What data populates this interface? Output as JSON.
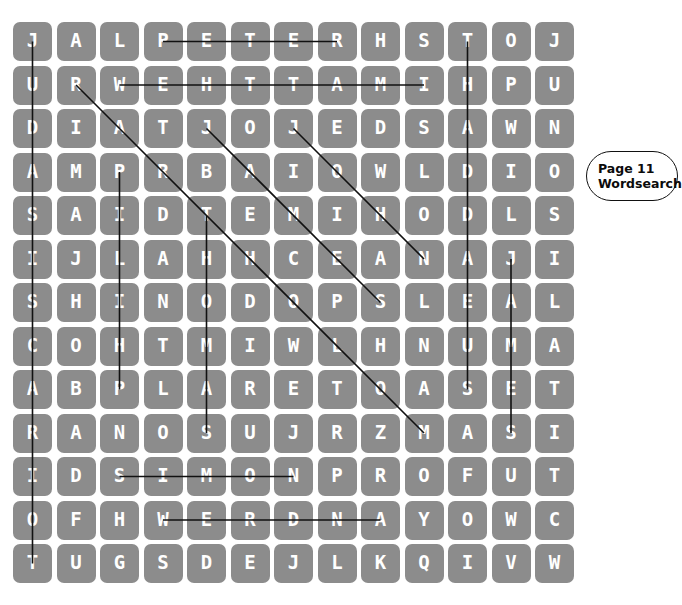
{
  "puzzle": {
    "type": "wordsearch",
    "rows": 13,
    "cols": 13,
    "cell_color": "#8c8c8c",
    "letter_color": "#ffffff",
    "line_color": "#111111",
    "grid": [
      [
        "J",
        "A",
        "L",
        "P",
        "E",
        "T",
        "E",
        "R",
        "H",
        "S",
        "T",
        "O",
        "J"
      ],
      [
        "U",
        "R",
        "W",
        "E",
        "H",
        "T",
        "T",
        "A",
        "M",
        "I",
        "H",
        "P",
        "U"
      ],
      [
        "D",
        "I",
        "A",
        "T",
        "J",
        "O",
        "J",
        "E",
        "D",
        "S",
        "A",
        "W",
        "N"
      ],
      [
        "A",
        "M",
        "P",
        "R",
        "B",
        "A",
        "I",
        "O",
        "W",
        "L",
        "D",
        "I",
        "O"
      ],
      [
        "S",
        "A",
        "I",
        "D",
        "T",
        "E",
        "M",
        "I",
        "H",
        "O",
        "D",
        "L",
        "S"
      ],
      [
        "I",
        "J",
        "L",
        "A",
        "H",
        "H",
        "C",
        "E",
        "A",
        "N",
        "A",
        "J",
        "I"
      ],
      [
        "S",
        "H",
        "I",
        "N",
        "O",
        "D",
        "O",
        "P",
        "S",
        "L",
        "E",
        "A",
        "L"
      ],
      [
        "C",
        "O",
        "H",
        "T",
        "M",
        "I",
        "W",
        "L",
        "H",
        "N",
        "U",
        "M",
        "A"
      ],
      [
        "A",
        "B",
        "P",
        "L",
        "A",
        "R",
        "E",
        "T",
        "O",
        "A",
        "S",
        "E",
        "T"
      ],
      [
        "R",
        "A",
        "N",
        "O",
        "S",
        "U",
        "J",
        "R",
        "Z",
        "M",
        "A",
        "S",
        "I"
      ],
      [
        "I",
        "D",
        "S",
        "I",
        "M",
        "O",
        "N",
        "P",
        "R",
        "O",
        "F",
        "U",
        "T"
      ],
      [
        "O",
        "F",
        "H",
        "W",
        "E",
        "R",
        "D",
        "N",
        "A",
        "Y",
        "O",
        "W",
        "C"
      ],
      [
        "T",
        "U",
        "G",
        "S",
        "D",
        "E",
        "J",
        "L",
        "K",
        "Q",
        "I",
        "V",
        "W"
      ]
    ],
    "solution_lines": [
      {
        "name": "line-vertical-col1",
        "from": [
          0,
          0
        ],
        "to": [
          12,
          0
        ]
      },
      {
        "name": "line-horizontal-row1",
        "from": [
          0,
          3
        ],
        "to": [
          0,
          7
        ]
      },
      {
        "name": "line-horizontal-row2",
        "from": [
          1,
          2
        ],
        "to": [
          1,
          9
        ]
      },
      {
        "name": "line-diagonal-from-r2c2",
        "from": [
          1,
          1
        ],
        "to": [
          9,
          9
        ]
      },
      {
        "name": "line-vertical-col3",
        "from": [
          3,
          2
        ],
        "to": [
          8,
          2
        ]
      },
      {
        "name": "line-vertical-col5",
        "from": [
          4,
          4
        ],
        "to": [
          9,
          4
        ]
      },
      {
        "name": "line-diagonal-from-r3c5",
        "from": [
          2,
          4
        ],
        "to": [
          6,
          8
        ]
      },
      {
        "name": "line-diagonal-from-r3c7",
        "from": [
          2,
          6
        ],
        "to": [
          5,
          9
        ]
      },
      {
        "name": "line-vertical-col11",
        "from": [
          0,
          10
        ],
        "to": [
          8,
          10
        ]
      },
      {
        "name": "line-vertical-col12",
        "from": [
          5,
          11
        ],
        "to": [
          9,
          11
        ]
      },
      {
        "name": "line-horizontal-row11",
        "from": [
          10,
          2
        ],
        "to": [
          10,
          6
        ]
      },
      {
        "name": "line-horizontal-row12",
        "from": [
          11,
          3
        ],
        "to": [
          11,
          8
        ]
      }
    ]
  },
  "callout": {
    "line1": "Page 11",
    "line2": "Wordsearch"
  }
}
